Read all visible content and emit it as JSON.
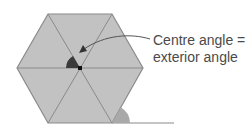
{
  "diagram": {
    "label_line1": "Centre angle =",
    "label_line2": "exterior angle",
    "colors": {
      "hexagon_fill": "#c2c2c2",
      "edge": "#8a8a8a",
      "centre_angle": "#3a3a3a",
      "exterior_angle": "#a9a9a9",
      "text": "#4a4a4a",
      "arrow": "#555555"
    }
  }
}
